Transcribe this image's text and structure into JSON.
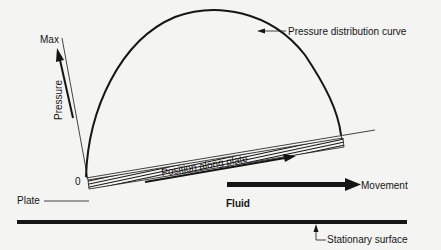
{
  "diagram": {
    "labels": {
      "max": "Max",
      "pressure": "Pressure",
      "origin": "0",
      "curve": "Pressure distribution curve",
      "position": "Position along plate",
      "movement": "Movement",
      "plate": "Plate",
      "fluid": "Fluid",
      "stationary": "Stationary surface"
    },
    "colors": {
      "background": "#f4f4f2",
      "ink": "#151515"
    }
  }
}
